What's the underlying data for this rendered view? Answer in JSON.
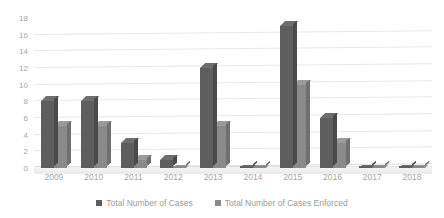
{
  "chart_data": {
    "type": "bar",
    "title": "",
    "xlabel": "",
    "ylabel": "",
    "ylim": [
      0,
      18
    ],
    "yticks": [
      0,
      2,
      4,
      6,
      8,
      10,
      12,
      14,
      16,
      18
    ],
    "grid": true,
    "legend_position": "bottom",
    "categories": [
      "2009",
      "2010",
      "2011",
      "2012",
      "2013",
      "2014",
      "2015",
      "2016",
      "2017",
      "2018"
    ],
    "series": [
      {
        "name": "Total Number of Cases",
        "color": "#5e5e5e",
        "values": [
          8,
          8,
          3,
          1,
          12,
          0,
          17,
          6,
          0,
          0
        ]
      },
      {
        "name": "Total Number of Cases Enforced",
        "color": "#8a8a8a",
        "values": [
          5,
          5,
          1,
          0,
          5,
          0,
          10,
          3,
          0,
          0
        ]
      }
    ]
  },
  "legend": {
    "items": [
      {
        "label": "Total Number of Cases",
        "marker": "square-marker-dark"
      },
      {
        "label": "Total Number of Cases Enforced",
        "marker": "square-marker-light"
      }
    ]
  }
}
